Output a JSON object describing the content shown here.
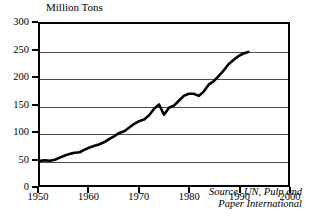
{
  "chart_data": {
    "type": "line",
    "title": "Million Tons",
    "xlabel": "",
    "ylabel": "Million Tons",
    "xlim": [
      1950,
      2000
    ],
    "ylim": [
      0,
      300
    ],
    "y_ticks": [
      0,
      50,
      100,
      150,
      200,
      250,
      300
    ],
    "x_ticks": [
      1950,
      1960,
      1970,
      1980,
      1990,
      2000
    ],
    "grid": "horizontal",
    "legend": "none",
    "annotations": [
      "Source: UN, Pulp and",
      "Paper International"
    ],
    "series": [
      {
        "name": "World Paper Production",
        "x": [
          1950,
          1951,
          1952,
          1953,
          1954,
          1955,
          1956,
          1957,
          1958,
          1959,
          1960,
          1961,
          1962,
          1963,
          1964,
          1965,
          1966,
          1967,
          1968,
          1969,
          1970,
          1971,
          1972,
          1973,
          1974,
          1975,
          1976,
          1977,
          1978,
          1979,
          1980,
          1981,
          1982,
          1983,
          1984,
          1985,
          1986,
          1987,
          1988,
          1989,
          1990,
          1991,
          1992
        ],
        "values": [
          45,
          46,
          45,
          47,
          51,
          55,
          58,
          60,
          61,
          66,
          70,
          73,
          76,
          80,
          86,
          91,
          97,
          100,
          107,
          114,
          119,
          122,
          130,
          142,
          150,
          131,
          144,
          148,
          157,
          166,
          170,
          170,
          166,
          174,
          187,
          193,
          203,
          213,
          225,
          233,
          240,
          245,
          248
        ]
      }
    ]
  },
  "axis": {
    "y_tick_labels": [
      "300",
      "250",
      "200",
      "150",
      "100",
      "50",
      "0"
    ],
    "x_tick_labels": [
      "1950",
      "1960",
      "1970",
      "1980",
      "1990",
      "2000"
    ]
  },
  "source": {
    "line1": "Source: UN, Pulp and",
    "line2": "Paper International"
  },
  "colors": {
    "line": "#000000",
    "grid": "#4a4a4a",
    "frame": "#000000",
    "background": "#ffffff"
  }
}
